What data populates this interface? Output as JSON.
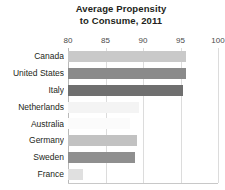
{
  "chart_data": {
    "type": "bar",
    "orientation": "horizontal",
    "title": "Average Propensity to Consume, 2011",
    "title_lines": [
      "Average Propensity",
      "to Consume, 2011"
    ],
    "xlabel": "",
    "ylabel": "",
    "xlim": [
      80,
      100
    ],
    "ticks": [
      80,
      85,
      90,
      95,
      100
    ],
    "tick_labels": [
      "80",
      "85",
      "90",
      "95",
      "100"
    ],
    "grid": true,
    "grid_axis": "x",
    "legend": false,
    "categories": [
      "Canada",
      "United States",
      "Italy",
      "Netherlands",
      "Australia",
      "Germany",
      "Sweden",
      "France"
    ],
    "values": [
      95.7,
      95.7,
      95.3,
      89.4,
      88.2,
      89.2,
      88.9,
      82.0
    ],
    "bar_colors": [
      "#c9c9c9",
      "#8a8a8a",
      "#6f6f6f",
      "#f4f4f4",
      "#fbfbfb",
      "#c2c2c2",
      "#8f8f8f",
      "#e0e0e0"
    ],
    "series": [
      {
        "name": "Average Propensity to Consume, 2011",
        "values": [
          95.7,
          95.7,
          95.3,
          89.4,
          88.2,
          89.2,
          88.9,
          82.0
        ]
      }
    ]
  },
  "colors": {
    "background": "#ffffff",
    "text": "#231f20",
    "tick_text": "#4a4a4a",
    "gridline": "#dcdcdc",
    "axis": "#b9b9b9"
  }
}
